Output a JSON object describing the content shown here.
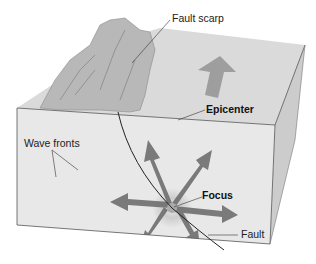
{
  "diagram": {
    "labels": {
      "fault_scarp": "Fault scarp",
      "epicenter": "Epicenter",
      "wave_fronts": "Wave fronts",
      "focus": "Focus",
      "fault": "Fault"
    },
    "colors": {
      "block_top": "#d9d9d9",
      "block_front": "#e4e4e4",
      "block_side": "#cfcfcf",
      "wave_ring": "#c8c8c8",
      "arrow": "#6e6e6e",
      "line": "#222222"
    }
  }
}
